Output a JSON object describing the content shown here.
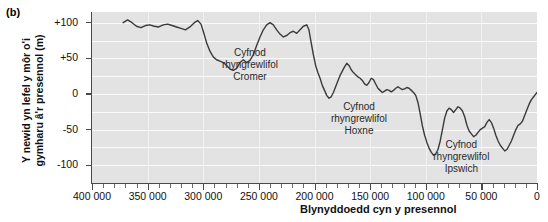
{
  "panel": {
    "label": "(b)"
  },
  "chart_data": {
    "type": "line",
    "title": "",
    "xlabel": "Blynyddoedd cyn y presennol",
    "ylabel": "Y newid yn lefel y môr o'i gymharu â'r presennol (m)",
    "xlim": [
      400000,
      0
    ],
    "ylim": [
      -125,
      115
    ],
    "x_ticks": [
      400000,
      350000,
      300000,
      250000,
      200000,
      150000,
      100000,
      50000,
      0
    ],
    "x_tick_labels": [
      "400 000",
      "350 000",
      "300 000",
      "250 000",
      "200 000",
      "150 000",
      "100 000",
      "50 000",
      "0"
    ],
    "x_minor_interval": 10000,
    "y_ticks": [
      100,
      50,
      0,
      -50,
      -100
    ],
    "y_tick_labels": [
      "+100",
      "+50",
      "0",
      "-50",
      "-100"
    ],
    "grid": "horizontal-white-bands",
    "legend": "none",
    "x_axis_direction": "reversed",
    "series": [
      {
        "name": "Newid yn lefel y môr",
        "units": "m",
        "points": [
          [
            372000,
            100
          ],
          [
            368000,
            104
          ],
          [
            364000,
            100
          ],
          [
            360000,
            95
          ],
          [
            356000,
            93
          ],
          [
            352000,
            96
          ],
          [
            348000,
            97
          ],
          [
            344000,
            95
          ],
          [
            340000,
            94
          ],
          [
            336000,
            97
          ],
          [
            332000,
            98
          ],
          [
            328000,
            96
          ],
          [
            324000,
            94
          ],
          [
            320000,
            92
          ],
          [
            316000,
            90
          ],
          [
            312000,
            94
          ],
          [
            308000,
            100
          ],
          [
            305000,
            103
          ],
          [
            302000,
            98
          ],
          [
            300000,
            88
          ],
          [
            297000,
            72
          ],
          [
            294000,
            60
          ],
          [
            291000,
            52
          ],
          [
            288000,
            48
          ],
          [
            285000,
            46
          ],
          [
            282000,
            44
          ],
          [
            279000,
            40
          ],
          [
            276000,
            35
          ],
          [
            273000,
            33
          ],
          [
            270000,
            36
          ],
          [
            267000,
            44
          ],
          [
            264000,
            48
          ],
          [
            261000,
            44
          ],
          [
            258000,
            47
          ],
          [
            255000,
            55
          ],
          [
            252000,
            68
          ],
          [
            249000,
            80
          ],
          [
            246000,
            90
          ],
          [
            243000,
            97
          ],
          [
            240000,
            100
          ],
          [
            237000,
            97
          ],
          [
            234000,
            90
          ],
          [
            231000,
            84
          ],
          [
            228000,
            80
          ],
          [
            225000,
            82
          ],
          [
            222000,
            86
          ],
          [
            219000,
            88
          ],
          [
            216000,
            85
          ],
          [
            213000,
            90
          ],
          [
            210000,
            95
          ],
          [
            207000,
            97
          ],
          [
            205000,
            90
          ],
          [
            203000,
            72
          ],
          [
            201000,
            55
          ],
          [
            199000,
            40
          ],
          [
            197000,
            30
          ],
          [
            195000,
            22
          ],
          [
            193000,
            12
          ],
          [
            191000,
            5
          ],
          [
            189000,
            -2
          ],
          [
            187000,
            -6
          ],
          [
            185000,
            -4
          ],
          [
            183000,
            2
          ],
          [
            181000,
            10
          ],
          [
            179000,
            18
          ],
          [
            177000,
            26
          ],
          [
            175000,
            32
          ],
          [
            173000,
            38
          ],
          [
            171000,
            43
          ],
          [
            169000,
            40
          ],
          [
            167000,
            34
          ],
          [
            165000,
            30
          ],
          [
            163000,
            27
          ],
          [
            161000,
            24
          ],
          [
            159000,
            22
          ],
          [
            157000,
            19
          ],
          [
            155000,
            14
          ],
          [
            153000,
            12
          ],
          [
            151000,
            16
          ],
          [
            149000,
            22
          ],
          [
            147000,
            20
          ],
          [
            145000,
            14
          ],
          [
            143000,
            8
          ],
          [
            141000,
            5
          ],
          [
            139000,
            2
          ],
          [
            137000,
            4
          ],
          [
            135000,
            6
          ],
          [
            133000,
            5
          ],
          [
            131000,
            3
          ],
          [
            129000,
            5
          ],
          [
            127000,
            8
          ],
          [
            125000,
            10
          ],
          [
            123000,
            8
          ],
          [
            121000,
            6
          ],
          [
            119000,
            7
          ],
          [
            117000,
            9
          ],
          [
            115000,
            8
          ],
          [
            113000,
            5
          ],
          [
            111000,
            2
          ],
          [
            109000,
            -2
          ],
          [
            107000,
            -12
          ],
          [
            105000,
            -28
          ],
          [
            103000,
            -45
          ],
          [
            101000,
            -58
          ],
          [
            99000,
            -68
          ],
          [
            97000,
            -76
          ],
          [
            95000,
            -82
          ],
          [
            93000,
            -86
          ],
          [
            91000,
            -84
          ],
          [
            89000,
            -78
          ],
          [
            87000,
            -66
          ],
          [
            85000,
            -50
          ],
          [
            83000,
            -34
          ],
          [
            81000,
            -24
          ],
          [
            79000,
            -20
          ],
          [
            77000,
            -22
          ],
          [
            75000,
            -26
          ],
          [
            73000,
            -22
          ],
          [
            71000,
            -18
          ],
          [
            69000,
            -20
          ],
          [
            67000,
            -24
          ],
          [
            65000,
            -32
          ],
          [
            63000,
            -44
          ],
          [
            61000,
            -52
          ],
          [
            59000,
            -56
          ],
          [
            57000,
            -60
          ],
          [
            55000,
            -58
          ],
          [
            53000,
            -54
          ],
          [
            51000,
            -50
          ],
          [
            49000,
            -48
          ],
          [
            47000,
            -46
          ],
          [
            45000,
            -40
          ],
          [
            43000,
            -36
          ],
          [
            41000,
            -40
          ],
          [
            39000,
            -48
          ],
          [
            37000,
            -58
          ],
          [
            35000,
            -66
          ],
          [
            33000,
            -72
          ],
          [
            31000,
            -76
          ],
          [
            29000,
            -80
          ],
          [
            27000,
            -78
          ],
          [
            25000,
            -72
          ],
          [
            23000,
            -66
          ],
          [
            21000,
            -58
          ],
          [
            19000,
            -50
          ],
          [
            17000,
            -44
          ],
          [
            15000,
            -42
          ],
          [
            13000,
            -38
          ],
          [
            11000,
            -30
          ],
          [
            9000,
            -22
          ],
          [
            7000,
            -14
          ],
          [
            5000,
            -8
          ],
          [
            3000,
            -4
          ],
          [
            1000,
            0
          ],
          [
            0,
            2
          ]
        ]
      }
    ],
    "annotations": [
      {
        "text_lines": [
          "Cyfnod",
          "rhyngrewlifol",
          "Cromer"
        ],
        "x": 258000,
        "y": 58
      },
      {
        "text_lines": [
          "Cyfnod",
          "rhyngrewlifol",
          "Hoxne"
        ],
        "x": 160000,
        "y": -18
      },
      {
        "text_lines": [
          "Cyfnod",
          "rhyngrewlifol",
          "Ipswich"
        ],
        "x": 68000,
        "y": -72
      }
    ]
  },
  "colors": {
    "plot_background": "#e3e3e3",
    "gridline": "#fafafa",
    "curve": "#3a3a3a",
    "axis": "#4a4a4a",
    "text": "#111111",
    "annotation_text": "#2a2a2a"
  }
}
